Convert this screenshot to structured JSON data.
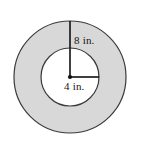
{
  "figure": {
    "kind": "annulus-diagram",
    "background_color": "#ffffff",
    "outer_circle": {
      "name": "outer-circle",
      "center_x": 70,
      "center_y": 77,
      "radius": 56,
      "fill_color": "#d8d8d8",
      "stroke_color": "#3a3a3a",
      "stroke_width": 1.2
    },
    "inner_circle": {
      "name": "inner-circle",
      "center_x": 70,
      "center_y": 77,
      "radius": 29,
      "fill_color": "#ffffff",
      "stroke_color": "#3a3a3a",
      "stroke_width": 1.2
    },
    "center_dot": {
      "name": "center-point",
      "x": 70,
      "y": 77,
      "radius": 2.1,
      "color": "#111111"
    },
    "radii": [
      {
        "name": "outer-radius-line",
        "from_x": 70,
        "from_y": 77,
        "to_x": 70,
        "to_y": 21,
        "orientation": "vertical",
        "color": "#111111",
        "width": 1.6,
        "label": "8 in."
      },
      {
        "name": "inner-radius-line",
        "from_x": 70,
        "from_y": 77,
        "to_x": 99,
        "to_y": 77,
        "orientation": "horizontal",
        "color": "#111111",
        "width": 1.6,
        "label": "4 in."
      }
    ],
    "labels": {
      "outer_radius": "8 in.",
      "inner_radius": "4 in."
    }
  }
}
